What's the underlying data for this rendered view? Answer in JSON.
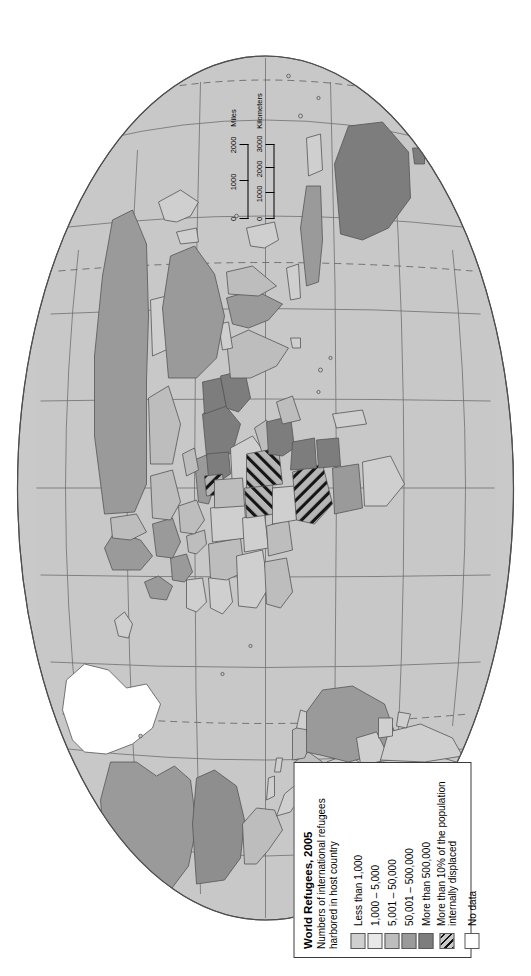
{
  "map": {
    "kind": "world-choropleth",
    "projection": "oval (Robinson-like) world projection",
    "orientation_note": "entire map page rotated 90 degrees counter-clockwise",
    "colors": {
      "page_background": "#ffffff",
      "ocean": "#ffffff",
      "base_land": "#c9c9c9",
      "graticule": "#6e6e6e",
      "country_border": "#555555",
      "class_1": "#cfcfcf",
      "class_2": "#e6e6e6",
      "class_3": "#bdbdbd",
      "class_4": "#9a9a9a",
      "class_5": "#7d7d7d",
      "class_idp_hatch": "#111111",
      "class_no_data": "#ffffff"
    }
  },
  "legend": {
    "title": "World Refugees, 2005",
    "subtitle": "Numbers of international refugees harbored in host country",
    "items": [
      {
        "label": "Less than 1,000",
        "swatch": "class_1",
        "fill": "#cfcfcf"
      },
      {
        "label": "1,000 – 5,000",
        "swatch": "class_2",
        "fill": "#e6e6e6"
      },
      {
        "label": "5,001 – 50,000",
        "swatch": "class_3",
        "fill": "#bdbdbd"
      },
      {
        "label": "50,001 – 500,000",
        "swatch": "class_4",
        "fill": "#9a9a9a"
      },
      {
        "label": "More than 500,000",
        "swatch": "class_5",
        "fill": "#7d7d7d"
      },
      {
        "label": "More than 10% of the population internally displaced",
        "swatch": "hatch",
        "fill": "hatch"
      },
      {
        "label": "No data",
        "swatch": "class_no_data",
        "fill": "#ffffff"
      }
    ]
  },
  "scalebar": {
    "miles": {
      "unit_label": "Miles",
      "ticks": [
        "0",
        "1000",
        "2000"
      ]
    },
    "kilometers": {
      "unit_label": "Kilometers",
      "ticks": [
        "0",
        "1000",
        "2000",
        "3000"
      ]
    }
  }
}
